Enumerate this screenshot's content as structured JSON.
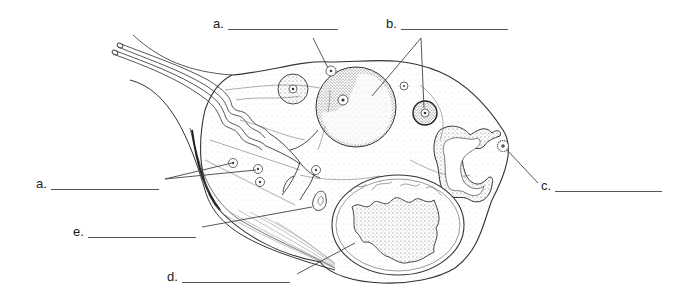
{
  "diagram": {
    "labels": [
      {
        "id": "a-top",
        "letter": "a.",
        "answer": "",
        "x": 213,
        "y": 17,
        "blank_width": 110
      },
      {
        "id": "b",
        "letter": "b.",
        "answer": "",
        "x": 386,
        "y": 17,
        "blank_width": 107
      },
      {
        "id": "a-left",
        "letter": "a.",
        "answer": "",
        "x": 36,
        "y": 177,
        "blank_width": 108
      },
      {
        "id": "c",
        "letter": "c.",
        "answer": "",
        "x": 541,
        "y": 179,
        "blank_width": 107
      },
      {
        "id": "e",
        "letter": "e.",
        "answer": "",
        "x": 73,
        "y": 225,
        "blank_width": 108
      },
      {
        "id": "d",
        "letter": "d.",
        "answer": "",
        "x": 167,
        "y": 270,
        "blank_width": 108
      }
    ],
    "colors": {
      "line": "#333333",
      "leader": "#444444",
      "stipple": "#777777",
      "background": "#ffffff"
    }
  }
}
